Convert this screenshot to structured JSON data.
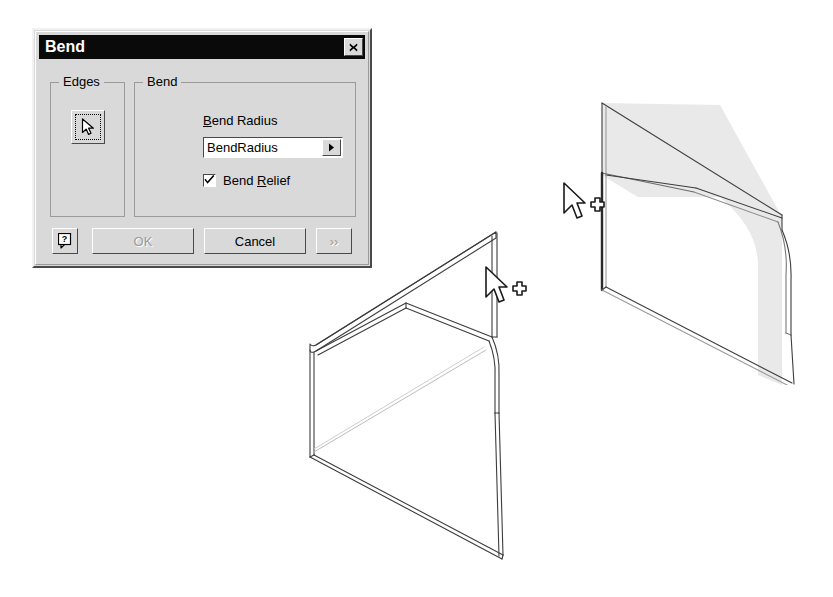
{
  "dialog": {
    "title": "Bend",
    "close_label": "✕",
    "groups": {
      "edges": {
        "title": "Edges",
        "select_button_icon": "cursor-arrow-icon"
      },
      "bend": {
        "title": "Bend",
        "radius_label_accel": "B",
        "radius_label_rest": "end Radius",
        "radius_value": "BendRadius",
        "radius_dropdown_icon": "▶",
        "relief_label_pre": "Bend ",
        "relief_label_accel": "R",
        "relief_label_rest": "elief",
        "relief_checked": true,
        "relief_check_glyph": "✓"
      }
    },
    "buttons": {
      "help": "?",
      "ok": "OK",
      "cancel": "Cancel",
      "more": "››",
      "ok_enabled": false,
      "cancel_enabled": true,
      "more_enabled": false
    }
  },
  "viewport": {
    "models": [
      {
        "name": "bent-sheet-wireframe",
        "style": "wireframe",
        "cursor": {
          "icon": "arrow-cursor-with-crosshair",
          "x": 198,
          "y": 48
        }
      },
      {
        "name": "bent-sheet-shaded",
        "style": "shaded",
        "face_fill": "#e8e8e8",
        "cursor": {
          "icon": "arrow-cursor-with-crosshair",
          "x": 54,
          "y": 123
        }
      }
    ]
  },
  "colors": {
    "dialog_face": "#d9d9d9",
    "titlebar": "#0a0a0a",
    "titlebar_text": "#ffffff",
    "field_background": "#ffffff",
    "border_dark": "#4a4a4a",
    "border_light": "#ffffff",
    "disabled_text": "#9a9a9a",
    "model_line": "#3a3a3a",
    "model_face": "#e8e8e8"
  }
}
